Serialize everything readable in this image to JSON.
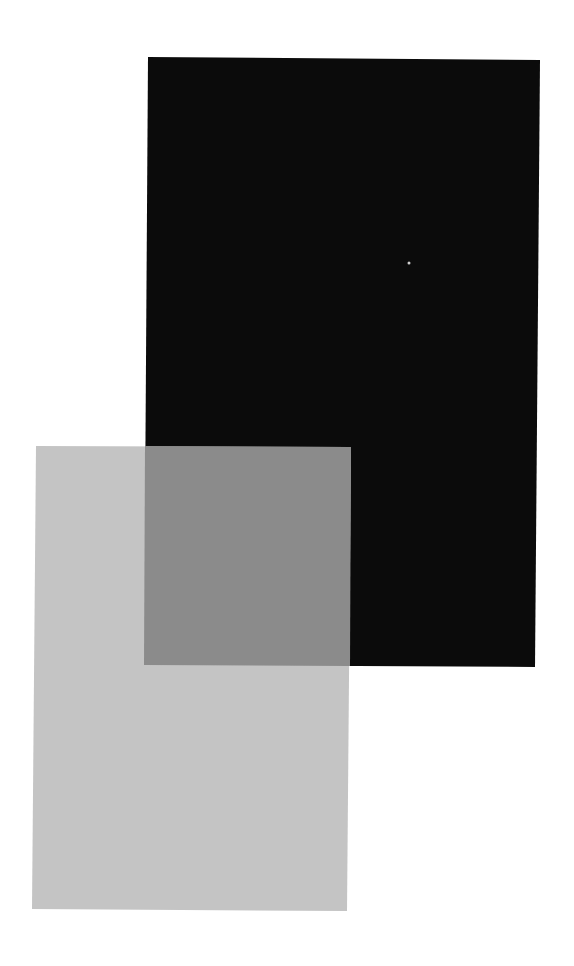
{
  "canvas": {
    "width": 574,
    "height": 966,
    "background": "#ffffff"
  },
  "shapes": {
    "black_rectangle": {
      "fill": "#0b0b0b",
      "points": "148,57 540,60 535,667 144,665"
    },
    "gray_rectangle": {
      "fill": "#c4c4c4",
      "points": "36,446 351,447 347,911 32,909"
    },
    "overlap_region": {
      "fill": "#8b8b8b",
      "points": "145,446 351,447 350,666 144,665"
    },
    "speck": {
      "fill": "#cfcfcf",
      "cx": 409,
      "cy": 263,
      "r": 1.5
    }
  }
}
